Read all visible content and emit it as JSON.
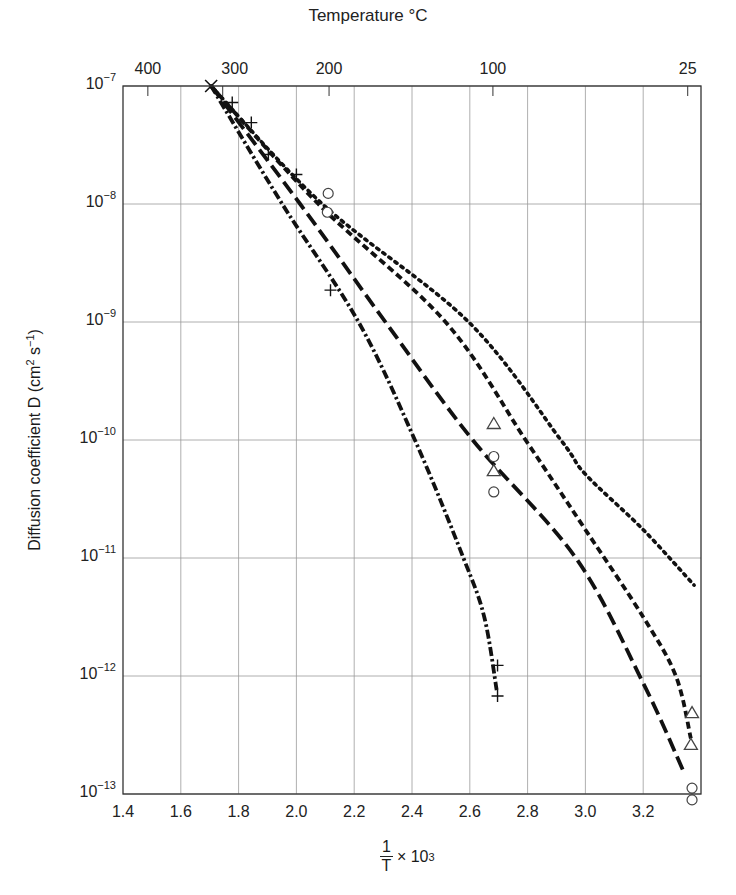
{
  "chart_data": {
    "type": "line",
    "title": "",
    "xlabel": "1/T × 10^3",
    "xlabel_parts": {
      "numerator": "1",
      "denominator": "T",
      "suffix": "× 10",
      "exponent": "3"
    },
    "ylabel": "Diffusion coefficient D (cm^2 s^-1)",
    "ylabel_parts": {
      "prefix": "Diffusion coefficient D (cm",
      "exp1": "2",
      "mid": " s",
      "exp2": "−1",
      "suffix": ")"
    },
    "top_axis_label": "Temperature °C",
    "xlim": [
      1.4,
      3.4
    ],
    "ylim": [
      1e-13,
      1e-07
    ],
    "yscale": "log",
    "grid": true,
    "legend": null,
    "x_ticks": [
      "1.4",
      "1.6",
      "1.8",
      "2.0",
      "2.2",
      "2.4",
      "2.6",
      "2.8",
      "3.0",
      "3.2"
    ],
    "x_tick_values": [
      1.4,
      1.6,
      1.8,
      2.0,
      2.2,
      2.4,
      2.6,
      2.8,
      3.0,
      3.2
    ],
    "y_ticks": [
      {
        "base": "10",
        "exp": "−7",
        "value": -7
      },
      {
        "base": "10",
        "exp": "−8",
        "value": -8
      },
      {
        "base": "10",
        "exp": "−9",
        "value": -9
      },
      {
        "base": "10",
        "exp": "−10",
        "value": -10
      },
      {
        "base": "10",
        "exp": "−11",
        "value": -11
      },
      {
        "base": "10",
        "exp": "−12",
        "value": -12
      },
      {
        "base": "10",
        "exp": "−13",
        "value": -13
      }
    ],
    "top_ticks": [
      {
        "label": "400",
        "x": 1.486
      },
      {
        "label": "300",
        "x": 1.745
      },
      {
        "label": "200",
        "x": 2.113
      },
      {
        "label": "100",
        "x": 2.68
      },
      {
        "label": "25",
        "x": 3.354
      }
    ],
    "series": [
      {
        "name": "dotted",
        "style": "dotted",
        "points_log10D": [
          [
            1.705,
            -7
          ],
          [
            2.09,
            -8
          ],
          [
            2.596,
            -9
          ],
          [
            2.915,
            -10
          ],
          [
            3.0,
            -10.29
          ],
          [
            3.2,
            -10.76
          ],
          [
            3.376,
            -11.23
          ]
        ]
      },
      {
        "name": "short-dashed",
        "style": "short-dash",
        "points_log10D": [
          [
            1.705,
            -7
          ],
          [
            2.076,
            -8
          ],
          [
            2.516,
            -9
          ],
          [
            2.793,
            -10
          ],
          [
            3.0,
            -10.76
          ],
          [
            3.2,
            -11.5
          ],
          [
            3.313,
            -12
          ],
          [
            3.365,
            -12.53
          ]
        ]
      },
      {
        "name": "long-dashed",
        "style": "long-dash",
        "points_log10D": [
          [
            1.705,
            -7
          ],
          [
            2.013,
            -8
          ],
          [
            2.308,
            -9
          ],
          [
            2.61,
            -10
          ],
          [
            2.967,
            -11
          ],
          [
            3.2,
            -12.06
          ],
          [
            3.338,
            -12.8
          ]
        ]
      },
      {
        "name": "dash-dot",
        "style": "dash-dot",
        "points_log10D": [
          [
            1.705,
            -7
          ],
          [
            1.951,
            -8
          ],
          [
            2.215,
            -9
          ],
          [
            2.41,
            -10
          ],
          [
            2.578,
            -11
          ],
          [
            2.65,
            -11.5
          ],
          [
            2.693,
            -12.12
          ]
        ]
      }
    ],
    "markers": {
      "cross": [
        [
          1.705,
          -7
        ]
      ],
      "plus": [
        [
          1.778,
          -7.14
        ],
        [
          1.844,
          -7.31
        ],
        [
          1.903,
          -7.58
        ],
        [
          2.0,
          -7.75
        ],
        [
          2.118,
          -8.73
        ],
        [
          2.696,
          -11.91
        ],
        [
          2.696,
          -12.17
        ]
      ],
      "circle": [
        [
          2.11,
          -7.91
        ],
        [
          2.107,
          -8.07
        ],
        [
          2.683,
          -10.14
        ],
        [
          2.683,
          -10.44
        ],
        [
          3.369,
          -12.95
        ],
        [
          3.369,
          -13.05
        ]
      ],
      "triangle": [
        [
          2.683,
          -9.86
        ],
        [
          2.683,
          -10.26
        ],
        [
          3.369,
          -12.31
        ],
        [
          3.365,
          -12.58
        ]
      ]
    }
  },
  "colors": {
    "line": "#111111",
    "grid": "#9a9a9a",
    "axis": "#333333",
    "marker": "#444444"
  }
}
